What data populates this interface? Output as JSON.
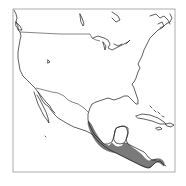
{
  "map": {
    "type": "species-range-map",
    "region": "North and Central America",
    "colors": {
      "background": "#ffffff",
      "coastline": "#1a1a1a",
      "range_fill": "#7a7a7a",
      "frame": "#9a9a9a"
    },
    "frame": {
      "x": 13,
      "y": 9,
      "width": 162,
      "height": 163
    },
    "range": {
      "label": "",
      "extent": "Southern Mexico through Central America to Panama"
    }
  }
}
